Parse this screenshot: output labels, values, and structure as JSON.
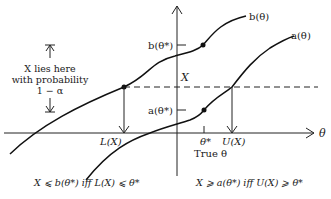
{
  "diagram": {
    "axes": {
      "x_label": "θ",
      "y_label": "X"
    },
    "curves": {
      "upper": {
        "label": "b(θ)"
      },
      "lower": {
        "label": "a(θ)"
      }
    },
    "y_marks": {
      "b_theta_star": "b(θ*)",
      "a_theta_star": "a(θ*)"
    },
    "x_marks": {
      "lower_bound": "L(X)",
      "theta_star": "θ*",
      "true_theta": "True θ",
      "upper_bound": "U(X)"
    },
    "interval_note": {
      "line1": "X lies here",
      "line2": "with probability",
      "line3": "1 − α"
    },
    "equivalences": {
      "left": "X ⩽ b(θ*) iff L(X) ⩽ θ*",
      "right": "X ⩾ a(θ*) iff U(X) ⩾ θ*"
    }
  }
}
